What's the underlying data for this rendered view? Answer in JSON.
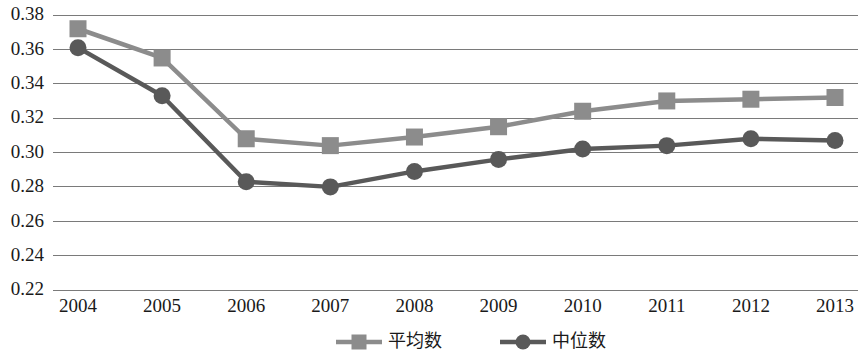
{
  "chart_data": {
    "type": "line",
    "title": "",
    "subtitle": "",
    "xlabel": "",
    "ylabel": "",
    "categories": [
      "2004",
      "2005",
      "2006",
      "2007",
      "2008",
      "2009",
      "2010",
      "2011",
      "2012",
      "2013"
    ],
    "ylim": [
      0.22,
      0.38
    ],
    "ytick_step": 0.02,
    "yticks": [
      "0.38",
      "0.36",
      "0.34",
      "0.32",
      "0.30",
      "0.28",
      "0.26",
      "0.24",
      "0.22"
    ],
    "ytick_values": [
      0.38,
      0.36,
      0.34,
      0.32,
      0.3,
      0.28,
      0.26,
      0.24,
      0.22
    ],
    "grid": true,
    "grid_axis": "y",
    "legend_position": "bottom",
    "series": [
      {
        "name": "平均数",
        "marker": "square",
        "color": "#8c8c8c",
        "values": [
          0.372,
          0.355,
          0.308,
          0.304,
          0.309,
          0.315,
          0.324,
          0.33,
          0.331,
          0.332
        ]
      },
      {
        "name": "中位数",
        "marker": "circle",
        "color": "#595959",
        "values": [
          0.361,
          0.333,
          0.283,
          0.28,
          0.289,
          0.296,
          0.302,
          0.304,
          0.308,
          0.307
        ]
      }
    ]
  },
  "legend": {
    "items": [
      {
        "label": "平均数",
        "marker": "square",
        "color": "#8c8c8c"
      },
      {
        "label": "中位数",
        "marker": "circle",
        "color": "#595959"
      }
    ]
  },
  "colors": {
    "mean_series": "#8c8c8c",
    "median_series": "#595959",
    "gridline": "#7a7a7a",
    "text": "#1a1a1a",
    "background": "#ffffff"
  }
}
